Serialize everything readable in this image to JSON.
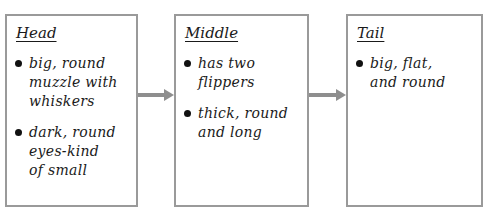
{
  "diagram": {
    "type": "flow-chart",
    "boxes": [
      {
        "title": "Head",
        "bullets": [
          "big, round\nmuzzle with\nwhiskers",
          "dark, round\neyes-kind\nof small"
        ]
      },
      {
        "title": "Middle",
        "bullets": [
          "has two\nflippers",
          "thick, round\nand long"
        ]
      },
      {
        "title": "Tail",
        "bullets": [
          "big, flat,\nand round"
        ]
      }
    ],
    "arrows": [
      {
        "from": "Head",
        "to": "Middle"
      },
      {
        "from": "Middle",
        "to": "Tail"
      }
    ],
    "colors": {
      "border": "#9a9a9a",
      "arrow": "#8e8e8e",
      "text": "#1a1a1a"
    }
  }
}
